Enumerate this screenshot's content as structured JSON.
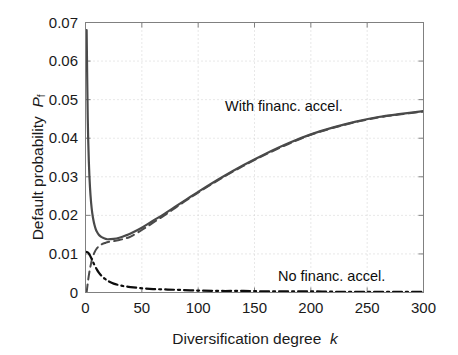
{
  "chart_data": {
    "type": "line",
    "title": "",
    "xlabel": "Diversification degree k",
    "ylabel": "Default probability P_f",
    "ylabel_main": "Default probability",
    "ylabel_symbol": "P",
    "ylabel_subscript": "f",
    "xlabel_main": "Diversification degree",
    "xlabel_symbol": "k",
    "xlim": [
      0,
      300
    ],
    "ylim": [
      0,
      0.07
    ],
    "xticks": [
      0,
      50,
      100,
      150,
      200,
      250,
      300
    ],
    "xtick_labels": [
      "0",
      "50",
      "100",
      "150",
      "200",
      "250",
      "300"
    ],
    "yticks": [
      0,
      0.01,
      0.02,
      0.03,
      0.04,
      0.05,
      0.06,
      0.07
    ],
    "ytick_labels": [
      "0",
      "0.01",
      "0.02",
      "0.03",
      "0.04",
      "0.05",
      "0.06",
      "0.07"
    ],
    "grid": true,
    "grid_style": "dotted",
    "legend_position": "inline-annotations",
    "annotations": [
      {
        "text": "With financ. accel.",
        "x": 150,
        "y": 0.0505
      },
      {
        "text": "No financ. accel.",
        "x": 215,
        "y": 0.0065
      }
    ],
    "series": [
      {
        "name": "With financ. accel. (solid)",
        "style": "solid",
        "color": "#4a4a4a",
        "width": 2.2,
        "x": [
          1,
          2,
          3,
          4,
          5,
          6,
          7,
          8,
          9,
          10,
          12,
          14,
          16,
          18,
          20,
          25,
          30,
          35,
          40,
          50,
          60,
          70,
          80,
          90,
          100,
          120,
          140,
          160,
          180,
          200,
          220,
          240,
          260,
          280,
          300
        ],
        "y": [
          0.068,
          0.0452,
          0.0337,
          0.0272,
          0.0232,
          0.0206,
          0.0188,
          0.0175,
          0.0165,
          0.0158,
          0.0149,
          0.0144,
          0.0141,
          0.0139,
          0.0138,
          0.0139,
          0.0142,
          0.0147,
          0.0153,
          0.0168,
          0.0186,
          0.0204,
          0.0223,
          0.0242,
          0.0261,
          0.0297,
          0.033,
          0.036,
          0.0387,
          0.041,
          0.0428,
          0.0443,
          0.0455,
          0.0463,
          0.047
        ]
      },
      {
        "name": "With financ. accel. (dashed approximation)",
        "style": "dashed",
        "color": "#4a4a4a",
        "width": 2.0,
        "x": [
          1,
          2,
          3,
          4,
          5,
          6,
          8,
          10,
          12,
          15,
          18,
          20,
          25,
          30,
          35,
          40,
          50,
          60,
          70,
          80,
          90,
          100,
          120,
          140,
          160,
          180,
          200,
          220,
          240,
          260,
          280,
          300
        ],
        "y": [
          0.0,
          0.0024,
          0.0045,
          0.0062,
          0.0076,
          0.0088,
          0.0104,
          0.0114,
          0.012,
          0.0126,
          0.0129,
          0.0131,
          0.0133,
          0.0136,
          0.014,
          0.0145,
          0.0162,
          0.0181,
          0.02,
          0.022,
          0.024,
          0.0259,
          0.0295,
          0.0328,
          0.0358,
          0.0385,
          0.0409,
          0.0427,
          0.0442,
          0.0454,
          0.0462,
          0.0469
        ]
      },
      {
        "name": "No financ. accel.",
        "style": "dashdot",
        "color": "#0d0d0d",
        "width": 2.2,
        "x": [
          1,
          2,
          3,
          4,
          5,
          6,
          7,
          8,
          10,
          12,
          14,
          16,
          18,
          20,
          25,
          30,
          35,
          40,
          50,
          60,
          70,
          80,
          100,
          120,
          140,
          160,
          180,
          200,
          220,
          240,
          260,
          280,
          300
        ],
        "y": [
          0.0105,
          0.0104,
          0.0101,
          0.0096,
          0.009,
          0.0083,
          0.0077,
          0.0071,
          0.006,
          0.0051,
          0.0044,
          0.0038,
          0.0034,
          0.003,
          0.0023,
          0.0019,
          0.0016,
          0.0014,
          0.0011,
          0.0009,
          0.0008,
          0.0007,
          0.0005,
          0.0004,
          0.0004,
          0.0003,
          0.0003,
          0.0003,
          0.0002,
          0.0002,
          0.0002,
          0.0002,
          0.0002
        ]
      }
    ]
  },
  "figure": {
    "background": "#ffffff",
    "axis_color": "#808080",
    "grid_color": "#cccccc",
    "text_color": "#1a1a1a"
  }
}
